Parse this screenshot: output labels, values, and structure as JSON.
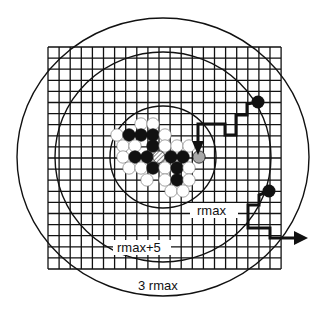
{
  "diagram": {
    "type": "dla-random-walk-simulation",
    "colors": {
      "line": "#111111",
      "background": "#ffffff",
      "seed_particle": "#111111",
      "candidate_site": "#ffffff",
      "arriving_walker": "#a8a8a8"
    },
    "lattice": {
      "x0": 48,
      "y0": 47,
      "x1": 281,
      "y1": 269,
      "cell": 11.1
    },
    "circles": [
      {
        "id": "inner",
        "label": "rmax",
        "cx": 163,
        "cy": 157,
        "rx": 53,
        "ry": 51
      },
      {
        "id": "middle",
        "label": "rmax+5",
        "cx": 163,
        "cy": 157,
        "rx": 108,
        "ry": 105
      },
      {
        "id": "outer",
        "label": "3 rmax",
        "cx": 163,
        "cy": 157,
        "rx": 146,
        "ry": 139
      }
    ],
    "labels": {
      "inner": "rmax",
      "middle": "rmax+5",
      "outer": "3 rmax"
    },
    "particles": [
      {
        "cx": 141,
        "cy": 124,
        "fill": "white"
      },
      {
        "cx": 153,
        "cy": 124,
        "fill": "white"
      },
      {
        "cx": 117,
        "cy": 135,
        "fill": "white"
      },
      {
        "cx": 129,
        "cy": 135,
        "fill": "black"
      },
      {
        "cx": 141,
        "cy": 135,
        "fill": "black"
      },
      {
        "cx": 153,
        "cy": 135,
        "fill": "black"
      },
      {
        "cx": 165,
        "cy": 135,
        "fill": "white"
      },
      {
        "cx": 123,
        "cy": 146,
        "fill": "white"
      },
      {
        "cx": 135,
        "cy": 146,
        "fill": "white"
      },
      {
        "cx": 153,
        "cy": 146,
        "fill": "black"
      },
      {
        "cx": 165,
        "cy": 146,
        "fill": "white"
      },
      {
        "cx": 177,
        "cy": 146,
        "fill": "white"
      },
      {
        "cx": 189,
        "cy": 146,
        "fill": "white"
      },
      {
        "cx": 123,
        "cy": 157,
        "fill": "white"
      },
      {
        "cx": 135,
        "cy": 157,
        "fill": "black"
      },
      {
        "cx": 147,
        "cy": 157,
        "fill": "black"
      },
      {
        "cx": 159,
        "cy": 157,
        "fill": "hatched"
      },
      {
        "cx": 171,
        "cy": 157,
        "fill": "black"
      },
      {
        "cx": 183,
        "cy": 157,
        "fill": "black"
      },
      {
        "cx": 199,
        "cy": 157,
        "fill": "grey"
      },
      {
        "cx": 129,
        "cy": 168,
        "fill": "white"
      },
      {
        "cx": 141,
        "cy": 168,
        "fill": "white"
      },
      {
        "cx": 153,
        "cy": 168,
        "fill": "black"
      },
      {
        "cx": 165,
        "cy": 168,
        "fill": "white"
      },
      {
        "cx": 177,
        "cy": 168,
        "fill": "black"
      },
      {
        "cx": 189,
        "cy": 168,
        "fill": "white"
      },
      {
        "cx": 147,
        "cy": 180,
        "fill": "white"
      },
      {
        "cx": 165,
        "cy": 180,
        "fill": "white"
      },
      {
        "cx": 177,
        "cy": 180,
        "fill": "black"
      },
      {
        "cx": 189,
        "cy": 180,
        "fill": "white"
      },
      {
        "cx": 171,
        "cy": 191,
        "fill": "white"
      },
      {
        "cx": 183,
        "cy": 191,
        "fill": "white"
      }
    ],
    "walkers": [
      {
        "id": "walker-sticks",
        "start": {
          "cx": 258,
          "cy": 102
        },
        "path": [
          [
            258,
            102
          ],
          [
            247,
            104
          ],
          [
            247,
            115
          ],
          [
            236,
            115
          ],
          [
            236,
            135
          ],
          [
            225,
            135
          ],
          [
            225,
            124
          ],
          [
            198,
            124
          ],
          [
            198,
            148
          ]
        ],
        "arrow_dir": "down",
        "arrow_tip": [
          198,
          155
        ]
      },
      {
        "id": "walker-escapes",
        "start": {
          "cx": 269,
          "cy": 191
        },
        "path": [
          [
            269,
            191
          ],
          [
            259,
            195
          ],
          [
            259,
            205
          ],
          [
            248,
            205
          ],
          [
            248,
            228
          ],
          [
            270,
            228
          ],
          [
            270,
            238
          ],
          [
            298,
            238
          ]
        ],
        "arrow_dir": "right",
        "arrow_tip": [
          308,
          238
        ]
      }
    ]
  }
}
